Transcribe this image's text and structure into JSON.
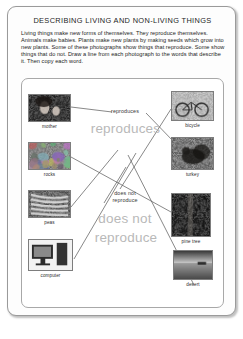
{
  "worksheet": {
    "title": "DESCRIBING LIVING AND NON-LIVING THINGS",
    "instructions": "Living things make new forms of themselves.  They reproduce themselves.  Animals make babies.  Plants make new plants by making seeds which grow into new plants.  Some of these photographs show things that reproduce.  Some show things that do not.  Draw a line from each photograph to the words that describe it.  Then copy each word."
  },
  "left_column": [
    {
      "caption": "mother",
      "image": "mother-photo"
    },
    {
      "caption": "rocks",
      "image": "rocks-photo"
    },
    {
      "caption": "peas",
      "image": "peas-photo"
    },
    {
      "caption": "computer",
      "image": "computer-photo"
    }
  ],
  "right_column": [
    {
      "caption": "bicycle",
      "image": "bicycle-photo"
    },
    {
      "caption": "turkey",
      "image": "turkey-photo"
    },
    {
      "caption": "pine tree",
      "image": "pine-tree-photo"
    },
    {
      "caption": "desert",
      "image": "desert-photo"
    }
  ],
  "center_words": {
    "reproduces_small": "reproduces",
    "reproduces_large": "reproduces",
    "does_not_small_line1": "does not",
    "does_not_small_line2": "reproduce",
    "does_not_large_line1": "does not",
    "does_not_large_line2": "reproduce"
  },
  "colors": {
    "page_border": "#9a9a9a",
    "text": "#1d1d1d",
    "trace_gray": "#b9b9b9",
    "line": "#555555"
  }
}
